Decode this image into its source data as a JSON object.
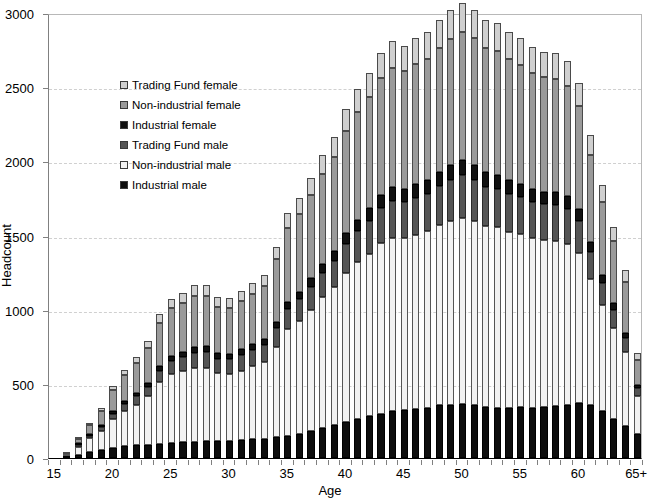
{
  "chart_data": {
    "type": "bar",
    "title": "",
    "subtitle": "",
    "xlabel": "Age",
    "ylabel": "Headcount",
    "ylim": [
      0,
      3000
    ],
    "y_ticks": [
      0,
      500,
      1000,
      1500,
      2000,
      2500,
      3000
    ],
    "grid": true,
    "stacked": true,
    "legend_position": "inside upper-left",
    "categories": [
      "15",
      "16",
      "17",
      "18",
      "19",
      "20",
      "21",
      "22",
      "23",
      "24",
      "25",
      "26",
      "27",
      "28",
      "29",
      "30",
      "31",
      "32",
      "33",
      "34",
      "35",
      "36",
      "37",
      "38",
      "39",
      "40",
      "41",
      "42",
      "43",
      "44",
      "45",
      "46",
      "47",
      "48",
      "49",
      "50",
      "51",
      "52",
      "53",
      "54",
      "55",
      "56",
      "57",
      "58",
      "59",
      "60",
      "61",
      "62",
      "63",
      "64",
      "65+"
    ],
    "x_tick_labels": [
      "15",
      "20",
      "25",
      "30",
      "35",
      "40",
      "45",
      "50",
      "55",
      "60",
      "65+"
    ],
    "series": [
      {
        "name": "Industrial male",
        "color": "#0d0d0d",
        "values": [
          0,
          8,
          20,
          40,
          55,
          70,
          80,
          85,
          90,
          95,
          100,
          105,
          110,
          115,
          115,
          118,
          120,
          125,
          130,
          140,
          150,
          165,
          185,
          205,
          225,
          245,
          265,
          285,
          300,
          315,
          325,
          330,
          340,
          355,
          360,
          365,
          355,
          345,
          340,
          340,
          345,
          340,
          345,
          350,
          360,
          370,
          355,
          315,
          265,
          215,
          165
        ]
      },
      {
        "name": "Non-industrial male",
        "color": "#f2f2f2",
        "values": [
          0,
          10,
          55,
          95,
          130,
          190,
          235,
          275,
          330,
          420,
          465,
          480,
          500,
          495,
          455,
          450,
          470,
          495,
          520,
          610,
          720,
          760,
          815,
          880,
          925,
          1005,
          1055,
          1090,
          1150,
          1170,
          1155,
          1175,
          1190,
          1215,
          1240,
          1255,
          1245,
          1220,
          1215,
          1185,
          1165,
          1140,
          1125,
          1115,
          1085,
          1015,
          855,
          715,
          610,
          500,
          250
        ]
      },
      {
        "name": "Trading Fund male",
        "color": "#555555",
        "values": [
          0,
          0,
          5,
          15,
          25,
          40,
          50,
          55,
          60,
          75,
          90,
          95,
          100,
          105,
          100,
          100,
          105,
          110,
          115,
          125,
          135,
          145,
          155,
          165,
          180,
          195,
          210,
          225,
          235,
          250,
          245,
          250,
          250,
          265,
          275,
          285,
          275,
          265,
          260,
          255,
          250,
          245,
          240,
          240,
          235,
          215,
          180,
          150,
          125,
          95,
          55
        ]
      },
      {
        "name": "Industrial female",
        "color": "#111111",
        "values": [
          0,
          0,
          3,
          8,
          12,
          18,
          22,
          25,
          28,
          32,
          35,
          36,
          38,
          38,
          36,
          36,
          37,
          38,
          40,
          44,
          48,
          52,
          56,
          60,
          66,
          72,
          78,
          84,
          88,
          92,
          90,
          92,
          92,
          96,
          100,
          104,
          100,
          96,
          94,
          92,
          90,
          88,
          86,
          86,
          84,
          78,
          66,
          54,
          45,
          34,
          20
        ]
      },
      {
        "name": "Non-industrial female",
        "color": "#9a9a9a",
        "values": [
          0,
          4,
          28,
          60,
          95,
          140,
          175,
          200,
          235,
          290,
          320,
          330,
          345,
          340,
          315,
          310,
          325,
          340,
          355,
          420,
          495,
          520,
          560,
          605,
          635,
          690,
          725,
          750,
          790,
          805,
          795,
          808,
          818,
          835,
          852,
          862,
          855,
          838,
          835,
          815,
          800,
          783,
          773,
          766,
          745,
          698,
          588,
          492,
          419,
          344,
          172
        ]
      },
      {
        "name": "Trading Fund female",
        "color": "#cfcfcf",
        "values": [
          0,
          0,
          4,
          12,
          18,
          27,
          33,
          40,
          47,
          58,
          65,
          69,
          72,
          72,
          64,
          66,
          68,
          72,
          75,
          86,
          102,
          108,
          119,
          125,
          134,
          143,
          152,
          161,
          167,
          178,
          170,
          175,
          180,
          184,
          193,
          199,
          190,
          186,
          186,
          183,
          180,
          174,
          171,
          173,
          171,
          153,
          131,
          114,
          95,
          82,
          43
        ]
      }
    ],
    "annotations": []
  },
  "legend": {
    "items": [
      {
        "label": "Trading Fund female",
        "swatch": "#cfcfcf",
        "icon": "legend-swatch-icon"
      },
      {
        "label": "Non-industrial female",
        "swatch": "#9a9a9a",
        "icon": "legend-swatch-icon"
      },
      {
        "label": "Industrial female",
        "swatch": "#111111",
        "icon": "legend-swatch-icon"
      },
      {
        "label": "Trading Fund male",
        "swatch": "#555555",
        "icon": "legend-swatch-icon"
      },
      {
        "label": "Non-industrial male",
        "swatch": "#f2f2f2",
        "icon": "legend-swatch-icon"
      },
      {
        "label": "Industrial male",
        "swatch": "#0d0d0d",
        "icon": "legend-swatch-icon"
      }
    ]
  },
  "axes": {
    "y_title": "Headcount",
    "x_title": "Age"
  }
}
